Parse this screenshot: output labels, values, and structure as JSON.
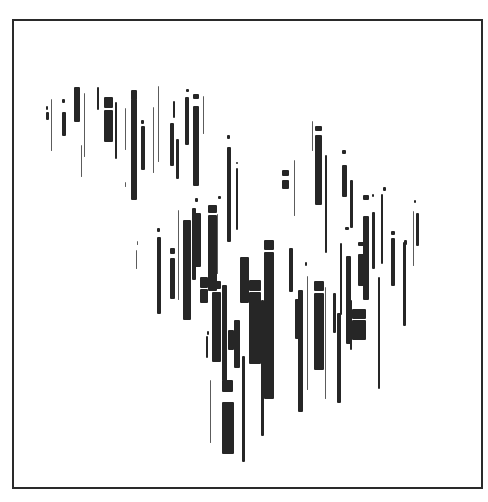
{
  "artwork": {
    "title": "",
    "ink_color": "#262626",
    "frame_color": "#2a2a2a",
    "background": "#ffffff",
    "bars": [
      [
        46,
        106,
        2,
        4
      ],
      [
        46,
        112,
        3,
        8
      ],
      [
        51,
        99,
        1,
        52
      ],
      [
        62,
        99,
        3,
        4
      ],
      [
        62,
        112,
        4,
        24
      ],
      [
        74,
        87,
        6,
        35
      ],
      [
        84,
        93,
        1,
        64
      ],
      [
        81,
        145,
        1,
        32
      ],
      [
        97,
        87,
        2,
        23
      ],
      [
        104,
        97,
        9,
        11
      ],
      [
        104,
        110,
        9,
        32
      ],
      [
        115,
        102,
        2,
        57
      ],
      [
        125,
        108,
        1,
        42
      ],
      [
        125,
        182,
        1,
        5
      ],
      [
        131,
        90,
        6,
        10
      ],
      [
        131,
        99,
        6,
        101
      ],
      [
        141,
        120,
        3,
        4
      ],
      [
        141,
        126,
        4,
        44
      ],
      [
        153,
        107,
        1,
        66
      ],
      [
        158,
        86,
        1,
        76
      ],
      [
        170,
        123,
        4,
        43
      ],
      [
        173,
        101,
        2,
        17
      ],
      [
        176,
        139,
        3,
        40
      ],
      [
        186,
        89,
        3,
        3
      ],
      [
        185,
        97,
        4,
        48
      ],
      [
        193,
        94,
        6,
        5
      ],
      [
        193,
        106,
        6,
        80
      ],
      [
        203,
        96,
        1,
        38
      ],
      [
        137,
        241,
        1,
        4
      ],
      [
        136,
        250,
        1,
        19
      ],
      [
        157,
        228,
        3,
        4
      ],
      [
        157,
        237,
        4,
        77
      ],
      [
        170,
        248,
        5,
        6
      ],
      [
        170,
        258,
        5,
        41
      ],
      [
        178,
        210,
        1,
        90
      ],
      [
        183,
        220,
        8,
        100
      ],
      [
        186,
        239,
        1,
        53
      ],
      [
        192,
        208,
        4,
        72
      ],
      [
        195,
        198,
        3,
        4
      ],
      [
        195,
        213,
        6,
        54
      ],
      [
        200,
        277,
        8,
        11
      ],
      [
        200,
        289,
        8,
        14
      ],
      [
        208,
        205,
        9,
        8
      ],
      [
        208,
        215,
        9,
        76
      ],
      [
        218,
        196,
        3,
        3
      ],
      [
        217,
        214,
        1,
        60
      ],
      [
        227,
        135,
        3,
        4
      ],
      [
        227,
        147,
        4,
        95
      ],
      [
        236,
        162,
        2,
        2
      ],
      [
        236,
        168,
        2,
        62
      ],
      [
        212,
        281,
        9,
        8
      ],
      [
        212,
        292,
        9,
        70
      ],
      [
        207,
        331,
        2,
        4
      ],
      [
        206,
        336,
        2,
        22
      ],
      [
        210,
        380,
        1,
        63
      ],
      [
        222,
        285,
        5,
        96
      ],
      [
        222,
        380,
        11,
        12
      ],
      [
        222,
        402,
        12,
        52
      ],
      [
        228,
        330,
        6,
        20
      ],
      [
        234,
        320,
        6,
        48
      ],
      [
        240,
        257,
        9,
        46
      ],
      [
        242,
        356,
        3,
        106
      ],
      [
        249,
        280,
        12,
        11
      ],
      [
        249,
        292,
        12,
        72
      ],
      [
        261,
        300,
        3,
        136
      ],
      [
        264,
        240,
        10,
        10
      ],
      [
        264,
        252,
        10,
        147
      ],
      [
        282,
        170,
        7,
        6
      ],
      [
        282,
        180,
        7,
        9
      ],
      [
        294,
        160,
        1,
        56
      ],
      [
        289,
        248,
        4,
        44
      ],
      [
        295,
        299,
        5,
        40
      ],
      [
        298,
        290,
        5,
        122
      ],
      [
        305,
        262,
        2,
        4
      ],
      [
        307,
        276,
        1,
        114
      ],
      [
        312,
        121,
        1,
        30
      ],
      [
        315,
        126,
        7,
        5
      ],
      [
        315,
        135,
        7,
        70
      ],
      [
        325,
        155,
        2,
        98
      ],
      [
        314,
        281,
        10,
        10
      ],
      [
        314,
        293,
        10,
        77
      ],
      [
        325,
        287,
        1,
        112
      ],
      [
        333,
        293,
        3,
        40
      ],
      [
        337,
        313,
        4,
        90
      ],
      [
        340,
        243,
        2,
        72
      ],
      [
        342,
        150,
        4,
        4
      ],
      [
        342,
        165,
        5,
        32
      ],
      [
        350,
        180,
        3,
        48
      ],
      [
        345,
        227,
        4,
        3
      ],
      [
        346,
        256,
        5,
        88
      ],
      [
        350,
        300,
        2,
        50
      ],
      [
        352,
        309,
        14,
        10
      ],
      [
        352,
        320,
        14,
        20
      ],
      [
        358,
        242,
        6,
        4
      ],
      [
        358,
        254,
        6,
        32
      ],
      [
        363,
        195,
        6,
        5
      ],
      [
        363,
        216,
        6,
        84
      ],
      [
        372,
        212,
        3,
        57
      ],
      [
        372,
        194,
        2,
        3
      ],
      [
        378,
        277,
        2,
        112
      ],
      [
        383,
        187,
        3,
        4
      ],
      [
        381,
        194,
        2,
        70
      ],
      [
        391,
        231,
        4,
        4
      ],
      [
        391,
        238,
        4,
        48
      ],
      [
        404,
        240,
        3,
        5
      ],
      [
        403,
        242,
        3,
        84
      ],
      [
        414,
        200,
        2,
        3
      ],
      [
        413,
        211,
        1,
        55
      ],
      [
        416,
        213,
        3,
        33
      ]
    ]
  }
}
